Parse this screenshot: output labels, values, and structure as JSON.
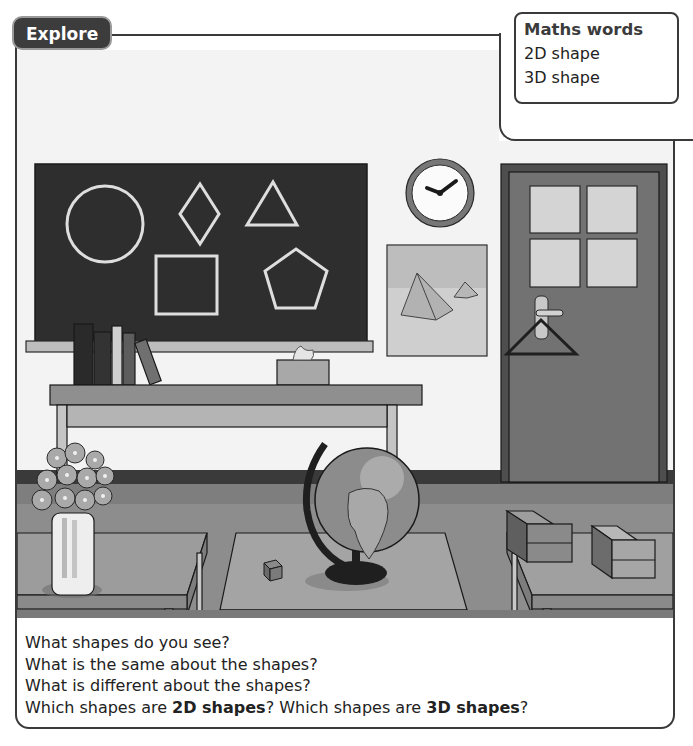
{
  "explore_tab": {
    "label": "Explore"
  },
  "maths_words": {
    "title": "Maths words",
    "words": [
      "2D shape",
      "3D shape"
    ]
  },
  "scene": {
    "description": "Classroom illustration",
    "blackboard": {
      "shapes": [
        "circle",
        "rhombus",
        "triangle",
        "square",
        "pentagon"
      ]
    },
    "objects": [
      "books",
      "tissue-box",
      "clock",
      "pyramid-picture",
      "door",
      "coat-hanger",
      "flower-vase",
      "globe",
      "cube",
      "boxes",
      "desks",
      "shelf-table"
    ],
    "clock_time": "2:45"
  },
  "questions": {
    "q1": "What shapes do you see?",
    "q2": "What is the same about the shapes?",
    "q3": "What is different about the shapes?",
    "q4_part1": "Which shapes are ",
    "q4_bold1": "2D shapes",
    "q4_part2": "? Which shapes are ",
    "q4_bold2": "3D shapes",
    "q4_part3": "?"
  },
  "colors": {
    "frame": "#3a3a3a",
    "tab_bg": "#3c3c3c",
    "blackboard": "#2f2f2f",
    "chalk": "#dcdcdc",
    "wall": "#f3f3f3",
    "floor": "#8a8a8a",
    "door": "#6e6e6e"
  }
}
